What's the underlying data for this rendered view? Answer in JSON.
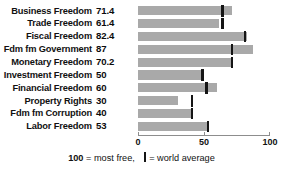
{
  "chart_data": {
    "type": "bar",
    "orientation": "horizontal",
    "title": "",
    "xlabel": "",
    "ylabel": "",
    "xlim": [
      0,
      100
    ],
    "grid": false,
    "legend_position": "bottom",
    "axis_ticks": [
      {
        "value": 0,
        "label": "0"
      },
      {
        "value": 50,
        "label": "50"
      },
      {
        "value": 100,
        "label": "100"
      }
    ],
    "categories": [
      "Business Freedom",
      "Trade Freedom",
      "Fiscal Freedom",
      "Fdm fm Government",
      "Monetary Freedom",
      "Investment Freedom",
      "Financial Freedom",
      "Property Rights",
      "Fdm fm Corruption",
      "Labor Freedom"
    ],
    "value_labels": [
      "71.4",
      "61.4",
      "82.4",
      "87",
      "70.2",
      "50",
      "60",
      "30",
      "40",
      "53"
    ],
    "series": [
      {
        "name": "Country score",
        "values": [
          71.4,
          61.4,
          82.4,
          87,
          70.2,
          50,
          60,
          30,
          40,
          53
        ]
      },
      {
        "name": "world average",
        "type": "marker",
        "values": [
          64,
          64,
          81,
          71,
          71,
          49,
          52,
          41,
          41,
          53
        ]
      }
    ],
    "footnote": {
      "bold_number": "100",
      "text_before": " = most free,",
      "marker_glyph": "|",
      "text_after": "= world average"
    }
  }
}
